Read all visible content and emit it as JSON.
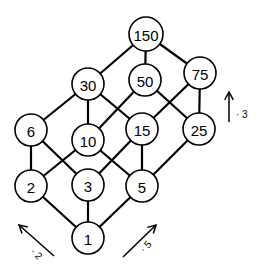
{
  "diagram": {
    "nodes": [
      {
        "id": "n150",
        "label": "150",
        "x": 146,
        "y": 34
      },
      {
        "id": "n30",
        "label": "30",
        "x": 88,
        "y": 84
      },
      {
        "id": "n50",
        "label": "50",
        "x": 145,
        "y": 80
      },
      {
        "id": "n75",
        "label": "75",
        "x": 200,
        "y": 73
      },
      {
        "id": "n6",
        "label": "6",
        "x": 31,
        "y": 130
      },
      {
        "id": "n10",
        "label": "10",
        "x": 88,
        "y": 140
      },
      {
        "id": "n15",
        "label": "15",
        "x": 142,
        "y": 129
      },
      {
        "id": "n25",
        "label": "25",
        "x": 199,
        "y": 129
      },
      {
        "id": "n2",
        "label": "2",
        "x": 31,
        "y": 186
      },
      {
        "id": "n3",
        "label": "3",
        "x": 88,
        "y": 185
      },
      {
        "id": "n5",
        "label": "5",
        "x": 142,
        "y": 186
      },
      {
        "id": "n1",
        "label": "1",
        "x": 88,
        "y": 238
      }
    ],
    "edges": [
      [
        "n150",
        "n30"
      ],
      [
        "n150",
        "n50"
      ],
      [
        "n150",
        "n75"
      ],
      [
        "n30",
        "n6"
      ],
      [
        "n30",
        "n10"
      ],
      [
        "n30",
        "n15"
      ],
      [
        "n50",
        "n10"
      ],
      [
        "n50",
        "n25"
      ],
      [
        "n75",
        "n15"
      ],
      [
        "n75",
        "n25"
      ],
      [
        "n6",
        "n2"
      ],
      [
        "n6",
        "n3"
      ],
      [
        "n10",
        "n2"
      ],
      [
        "n10",
        "n5"
      ],
      [
        "n15",
        "n3"
      ],
      [
        "n15",
        "n5"
      ],
      [
        "n25",
        "n5"
      ],
      [
        "n2",
        "n1"
      ],
      [
        "n3",
        "n1"
      ],
      [
        "n5",
        "n1"
      ]
    ],
    "arrows": [
      {
        "id": "times2",
        "label": "· 2",
        "x1": 54,
        "y1": 256,
        "x2": 19,
        "y2": 225,
        "lx": 30,
        "ly": 252,
        "rot": 45
      },
      {
        "id": "times5",
        "label": "· 5",
        "x1": 123,
        "y1": 257,
        "x2": 156,
        "y2": 225,
        "lx": 144,
        "ly": 253,
        "rot": -45
      },
      {
        "id": "times3",
        "label": "· 3",
        "x1": 229,
        "y1": 122,
        "x2": 229,
        "y2": 92,
        "lx": 236,
        "ly": 118,
        "rot": 0
      }
    ]
  }
}
